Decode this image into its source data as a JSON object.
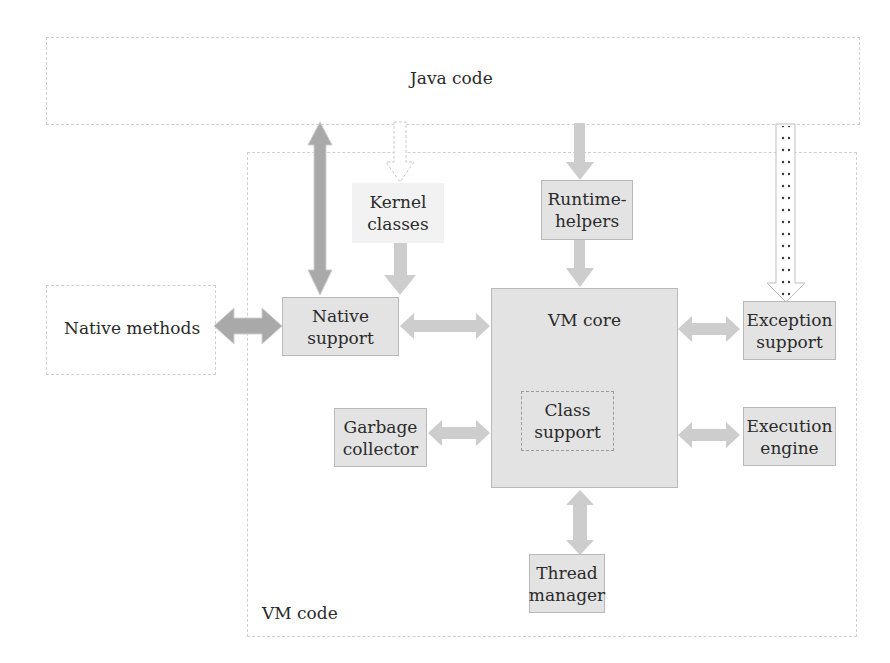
{
  "diagram": {
    "regions": {
      "java_code": "Java code",
      "vm_code": "VM code",
      "native_methods": "Native methods"
    },
    "components": {
      "kernel_classes_line1": "Kernel",
      "kernel_classes_line2": "classes",
      "runtime_helpers_line1": "Runtime-",
      "runtime_helpers_line2": "helpers",
      "native_support": "Native support",
      "vm_core": "VM core",
      "class_support_line1": "Class",
      "class_support_line2": "support",
      "exception_support_line1": "Exception",
      "exception_support_line2": "support",
      "garbage_collector_line1": "Garbage",
      "garbage_collector_line2": "collector",
      "execution_engine_line1": "Execution",
      "execution_engine_line2": "engine",
      "thread_manager_line1": "Thread",
      "thread_manager_line2": "manager"
    },
    "colors": {
      "box_fill": "#e3e3e3",
      "arrow_light": "#cdcdcd",
      "arrow_dark": "#a9a9a9",
      "dashed_border": "#cfcfcf"
    }
  }
}
